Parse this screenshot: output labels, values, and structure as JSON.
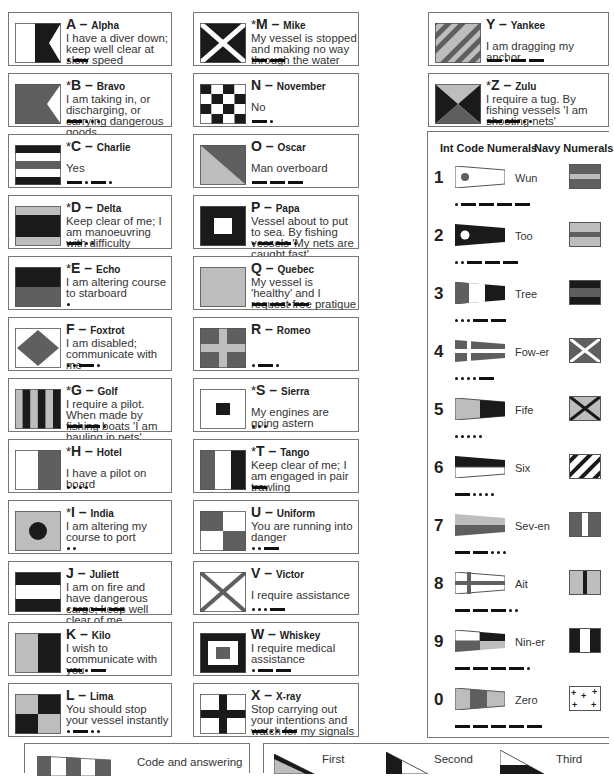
{
  "legend_note": "* = single-letter signals",
  "colors": {
    "dark": "#1a1a1a",
    "mid": "#5f5f5f",
    "light": "#bdbdbd",
    "white": "#ffffff",
    "border": "#777777"
  },
  "letters": [
    {
      "letter": "A",
      "star": "",
      "name": "Alpha",
      "message": "I have a diver down; keep well clear at slow speed",
      "morse": ".-"
    },
    {
      "letter": "B",
      "star": "*",
      "name": "Bravo",
      "message": "I am taking in, or discharging, or carrying dangerous goods",
      "morse": "-..."
    },
    {
      "letter": "C",
      "star": "*",
      "name": "Charlie",
      "message": "Yes",
      "morse": "-.-."
    },
    {
      "letter": "D",
      "star": "*",
      "name": "Delta",
      "message": "Keep clear of me; I am manoeuvring with difficulty",
      "morse": "-.."
    },
    {
      "letter": "E",
      "star": "*",
      "name": "Echo",
      "message": "I am altering course to starboard",
      "morse": "."
    },
    {
      "letter": "F",
      "star": "",
      "name": "Foxtrot",
      "message": "I am disabled; communicate with me",
      "morse": "..-."
    },
    {
      "letter": "G",
      "star": "*",
      "name": "Golf",
      "message": "I require a pilot. When made by fishing boats 'I am hauling in nets'",
      "morse": "--."
    },
    {
      "letter": "H",
      "star": "*",
      "name": "Hotel",
      "message": "I have a pilot on board",
      "morse": "...."
    },
    {
      "letter": "I",
      "star": "*",
      "name": "India",
      "message": "I am altering my course to port",
      "morse": ".."
    },
    {
      "letter": "J",
      "star": "",
      "name": "Juliett",
      "message": "I am on fire and have dangerous cargo; keep well clear of me",
      "morse": ".---"
    },
    {
      "letter": "K",
      "star": "",
      "name": "Kilo",
      "message": "I wish to communicate with you",
      "morse": "-.-"
    },
    {
      "letter": "L",
      "star": "",
      "name": "Lima",
      "message": "You should stop your vessel instantly",
      "morse": ".-.."
    },
    {
      "letter": "M",
      "star": "*",
      "name": "Mike",
      "message": "My vessel is stopped and making no way through the water",
      "morse": "--"
    },
    {
      "letter": "N",
      "star": "",
      "name": "November",
      "message": "No",
      "morse": "-."
    },
    {
      "letter": "O",
      "star": "",
      "name": "Oscar",
      "message": "Man overboard",
      "morse": "---"
    },
    {
      "letter": "P",
      "star": "",
      "name": "Papa",
      "message": "Vessel about to put to sea. By fishing vessels 'My nets are caught fast'",
      "morse": ".--."
    },
    {
      "letter": "Q",
      "star": "",
      "name": "Quebec",
      "message": "My vessel is 'healthy' and I request free pratique",
      "morse": "--.-"
    },
    {
      "letter": "R",
      "star": "",
      "name": "Romeo",
      "message": "",
      "morse": ".-."
    },
    {
      "letter": "S",
      "star": "*",
      "name": "Sierra",
      "message": "My engines are going astern",
      "morse": "..."
    },
    {
      "letter": "T",
      "star": "*",
      "name": "Tango",
      "message": "Keep clear of me; I am engaged in pair trawling",
      "morse": "-"
    },
    {
      "letter": "U",
      "star": "",
      "name": "Uniform",
      "message": "You are running into danger",
      "morse": "..-"
    },
    {
      "letter": "V",
      "star": "",
      "name": "Victor",
      "message": "I require assistance",
      "morse": "...-"
    },
    {
      "letter": "W",
      "star": "",
      "name": "Whiskey",
      "message": "I require medical assistance",
      "morse": ".--"
    },
    {
      "letter": "X",
      "star": "",
      "name": "X-ray",
      "message": "Stop carrying out your intentions and watch for my signals",
      "morse": "-..-"
    },
    {
      "letter": "Y",
      "star": "",
      "name": "Yankee",
      "message": "I am dragging my anchor",
      "morse": "-.--"
    },
    {
      "letter": "Z",
      "star": "*",
      "name": "Zulu",
      "message": "I require a tug. By fishing vessels 'I am shooting nets'",
      "morse": "--.."
    }
  ],
  "numerals": {
    "int_code_header": "Int Code Numerals",
    "navy_header": "Navy Numerals",
    "rows": [
      {
        "digit": "1",
        "word": "Wun",
        "morse": ".----"
      },
      {
        "digit": "2",
        "word": "Too",
        "morse": "..---"
      },
      {
        "digit": "3",
        "word": "Tree",
        "morse": "...--"
      },
      {
        "digit": "4",
        "word": "Fow-er",
        "morse": "....-"
      },
      {
        "digit": "5",
        "word": "Fife",
        "morse": "....."
      },
      {
        "digit": "6",
        "word": "Six",
        "morse": "-...."
      },
      {
        "digit": "7",
        "word": "Sev-en",
        "morse": "--..."
      },
      {
        "digit": "8",
        "word": "Ait",
        "morse": "---.."
      },
      {
        "digit": "9",
        "word": "Nin-er",
        "morse": "----."
      },
      {
        "digit": "0",
        "word": "Zero",
        "morse": "-----"
      }
    ]
  },
  "bottom": {
    "answering_label": "Code and answering",
    "substitutes": [
      {
        "label": "First"
      },
      {
        "label": "Second"
      },
      {
        "label": "Third"
      }
    ]
  }
}
